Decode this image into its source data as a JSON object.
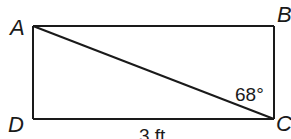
{
  "diagram": {
    "type": "rectangle-with-diagonal",
    "vertices": {
      "A": {
        "label": "A",
        "position": "top-left"
      },
      "B": {
        "label": "B",
        "position": "top-right"
      },
      "C": {
        "label": "C",
        "position": "bottom-right"
      },
      "D": {
        "label": "D",
        "position": "bottom-left"
      }
    },
    "segments": [
      "AB",
      "BC",
      "CD",
      "DA",
      "AC"
    ],
    "angle_label": "68°",
    "angle_at": "C",
    "angle_between": [
      "AC",
      "BC"
    ],
    "side_label": "3 ft",
    "side_labeled": "DC",
    "stroke_color": "#1a1a1a"
  }
}
